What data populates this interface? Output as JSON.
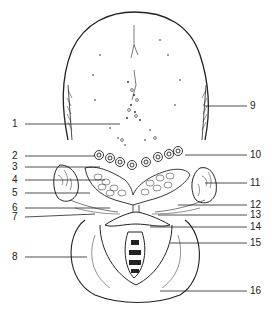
{
  "figure": {
    "type": "anatomical line drawing",
    "colors": {
      "ink": "#222222",
      "background": "#ffffff"
    }
  },
  "labels_left": [
    {
      "num": "1",
      "y": 124
    },
    {
      "num": "2",
      "y": 156
    },
    {
      "num": "3",
      "y": 167
    },
    {
      "num": "4",
      "y": 180
    },
    {
      "num": "5",
      "y": 193
    },
    {
      "num": "6",
      "y": 208
    },
    {
      "num": "7",
      "y": 217
    },
    {
      "num": "8",
      "y": 257
    }
  ],
  "labels_right": [
    {
      "num": "9",
      "y": 106
    },
    {
      "num": "10",
      "y": 155
    },
    {
      "num": "11",
      "y": 183
    },
    {
      "num": "12",
      "y": 205
    },
    {
      "num": "13",
      "y": 215
    },
    {
      "num": "14",
      "y": 227
    },
    {
      "num": "15",
      "y": 243
    },
    {
      "num": "16",
      "y": 291
    }
  ]
}
